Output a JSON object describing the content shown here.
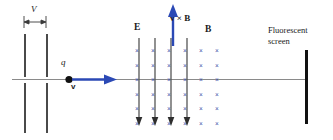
{
  "figure": {
    "type": "physics-diagram",
    "background": "#ffffff"
  },
  "colors": {
    "field_cross": "#3a4fa8",
    "velocity_arrow": "#2b49b5",
    "efield_line": "#555555",
    "plate": "#4a4a4a",
    "axis": "#8a8a8a",
    "screen": "#111111",
    "text": "#1a1a1a"
  },
  "labels": {
    "aperture_gap": "V",
    "charge": "q",
    "velocity": "v",
    "electric_field": "E",
    "magnetic_field": "B",
    "force_cross_product": "v × B",
    "screen_line1": "Fluorescent",
    "screen_line2": "screen"
  },
  "collimator": {
    "name": "aperture-plates",
    "plate_x": [
      24,
      46
    ],
    "plate_segments": [
      {
        "y": 34,
        "height": 43
      },
      {
        "y": 83,
        "height": 50
      }
    ],
    "dimension_arrow": {
      "y": 22,
      "x1": 24,
      "x2": 46
    }
  },
  "beam": {
    "axis_y": 79,
    "axis_x1": 12,
    "axis_x2": 306,
    "charge_dot": {
      "x": 69,
      "y": 79,
      "r": 3.6
    },
    "velocity_arrow": {
      "x1": 74,
      "x2": 114,
      "y": 79
    }
  },
  "field_region": {
    "name": "crossed-field-region",
    "cross_symbol": "×",
    "cross_columns_x": [
      137,
      153,
      169,
      185,
      201,
      217
    ],
    "cross_rows_y": [
      51,
      66,
      80,
      95,
      109,
      124
    ],
    "grid_cols": 6,
    "grid_rows": 6,
    "efield_lines_x": [
      139,
      155,
      171,
      187
    ],
    "efield_line_top": 38,
    "efield_line_bottom": 126,
    "vxb_arrow": {
      "x": 173,
      "y_top": 5,
      "y_bottom": 46
    }
  },
  "screen": {
    "name": "fluorescent-screen",
    "x": 305,
    "y_top": 50,
    "y_bottom": 124,
    "label_x": 268,
    "label_y": 29
  },
  "label_positions": {
    "V": {
      "x": 31,
      "y": 6
    },
    "E": {
      "x": 134,
      "y": 24
    },
    "B": {
      "x": 205,
      "y": 26
    },
    "vxB": {
      "x": 169,
      "y": 14
    },
    "q": {
      "x": 61,
      "y": 61
    },
    "v": {
      "x": 71,
      "y": 84
    }
  }
}
